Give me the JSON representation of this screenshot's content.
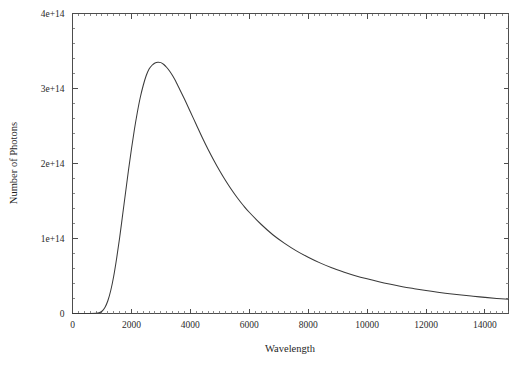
{
  "chart_data": {
    "type": "line",
    "title": "",
    "subtitle": "",
    "xlabel": "Wavelength",
    "ylabel": "Number of Photons",
    "xlim": [
      0,
      14800
    ],
    "ylim": [
      0,
      400000000000000
    ],
    "grid": false,
    "legend": null,
    "x_ticks": [
      0,
      2000,
      4000,
      6000,
      8000,
      10000,
      12000,
      14000
    ],
    "x_tick_labels": [
      "0",
      "2000",
      "4000",
      "6000",
      "8000",
      "10000",
      "12000",
      "14000"
    ],
    "x_minor_interval": 200,
    "y_ticks": [
      0,
      100000000000000,
      200000000000000,
      300000000000000,
      400000000000000
    ],
    "y_tick_labels": [
      "0",
      "1e+14",
      "2e+14",
      "3e+14",
      "4e+14"
    ],
    "y_minor_interval": 20000000000000,
    "series": [
      {
        "name": "Photon spectral distribution",
        "color": "#3a3a3a",
        "peak_x": 3050,
        "peak_y": 335000000000000,
        "x": [
          0,
          200,
          400,
          600,
          800,
          900,
          1000,
          1100,
          1200,
          1300,
          1400,
          1500,
          1600,
          1700,
          1800,
          1900,
          2000,
          2100,
          2200,
          2300,
          2400,
          2500,
          2600,
          2700,
          2800,
          2900,
          3000,
          3100,
          3200,
          3300,
          3400,
          3500,
          3600,
          3800,
          4000,
          4200,
          4400,
          4600,
          4800,
          5000,
          5200,
          5400,
          5600,
          5800,
          6000,
          6400,
          6800,
          7200,
          7600,
          8000,
          8400,
          8800,
          9200,
          9600,
          10000,
          10400,
          10800,
          11200,
          11600,
          12000,
          12400,
          12800,
          13200,
          13600,
          14000,
          14400,
          14800
        ],
        "y": [
          0,
          0,
          0,
          0,
          200000000000,
          900000000000,
          3000000000000,
          8000000000000,
          17000000000000,
          31000000000000,
          50000000000000,
          74000000000000,
          101000000000000,
          131000000000000,
          161000000000000,
          191000000000000,
          219000000000000,
          245000000000000,
          268000000000000,
          288000000000000,
          304000000000000,
          317000000000000,
          326000000000000,
          331000000000000,
          334000000000000,
          335000000000000,
          334500000000000,
          332000000000000,
          328000000000000,
          323000000000000,
          317000000000000,
          310000000000000,
          302000000000000,
          286000000000000,
          269000000000000,
          252000000000000,
          235000000000000,
          219000000000000,
          204000000000000,
          190000000000000,
          177000000000000,
          165000000000000,
          154000000000000,
          144000000000000,
          135000000000000,
          119000000000000,
          105000000000000,
          93500000000000,
          83500000000000,
          75000000000000,
          67500000000000,
          61000000000000,
          55500000000000,
          50500000000000,
          46200000000000,
          42300000000000,
          38900000000000,
          35800000000000,
          33100000000000,
          30600000000000,
          28400000000000,
          26400000000000,
          24600000000000,
          23000000000000,
          21500000000000,
          20100000000000,
          18900000000000
        ]
      }
    ]
  },
  "figure": {
    "background_color": "#ffffff",
    "frame_color": "#4d4d4d",
    "text_color": "#1f1f1f"
  }
}
